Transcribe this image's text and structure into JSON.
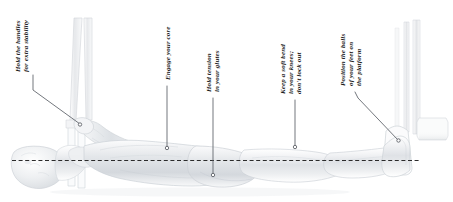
{
  "figure": {
    "type": "exercise-instruction-illustration",
    "alignment_line": {
      "name": "body-alignment-line",
      "style": "dashed",
      "color": "#2b2b2b",
      "orientation": "horizontal",
      "y": 160
    },
    "line_color": "#5a5e66",
    "text_color": "#1d1d1d",
    "background": "#ffffff"
  },
  "callouts": [
    {
      "id": "hold-handles",
      "lines": [
        "Hold the handles",
        "for extra stability"
      ],
      "anchor_x": 80,
      "anchor_y": 124
    },
    {
      "id": "engage-core",
      "lines": [
        "Engage your core"
      ],
      "anchor_x": 167,
      "anchor_y": 148
    },
    {
      "id": "hold-tension-glutes",
      "lines": [
        "Hold tension",
        "in your glutes"
      ],
      "anchor_x": 213,
      "anchor_y": 175
    },
    {
      "id": "soft-bend-knees",
      "lines": [
        "Keep a soft bend",
        "in your knees;",
        "don't lock out"
      ],
      "anchor_x": 295,
      "anchor_y": 147
    },
    {
      "id": "balls-of-feet",
      "lines": [
        "Position the balls",
        "of your feet on",
        "the platform"
      ],
      "anchor_x": 398,
      "anchor_y": 141
    }
  ],
  "equipment": {
    "straps_label": "suspension-straps",
    "platform_label": "foot-platform",
    "frame_label": "upright-frame"
  }
}
